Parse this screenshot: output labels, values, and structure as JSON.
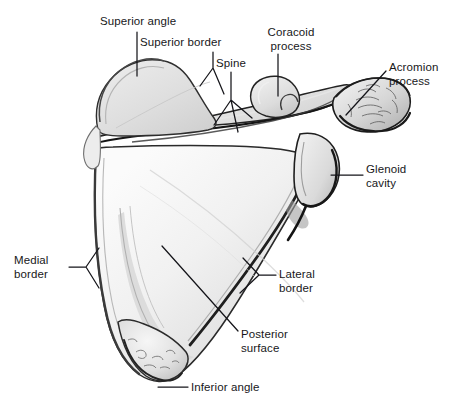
{
  "figure": {
    "background_color": "#ffffff",
    "label_color": "#17171a",
    "bone_fill_light": "#f4f4f4",
    "bone_fill_mid": "#e3e3e3",
    "bone_fill_shadow": "#c9c9c9",
    "outline_color": "#1b1b1b"
  },
  "labels": {
    "superior_angle": "Superior angle",
    "superior_border": "Superior border",
    "spine": "Spine",
    "coracoid_process_line1": "Coracoid",
    "coracoid_process_line2": "process",
    "acromion_process_line1": "Acromion",
    "acromion_process_line2": "process",
    "glenoid_cavity_line1": "Glenoid",
    "glenoid_cavity_line2": "cavity",
    "medial_border_line1": "Medial",
    "medial_border_line2": "border",
    "lateral_border_line1": "Lateral",
    "lateral_border_line2": "border",
    "posterior_surface_line1": "Posterior",
    "posterior_surface_line2": "surface",
    "inferior_angle": "Inferior angle"
  }
}
